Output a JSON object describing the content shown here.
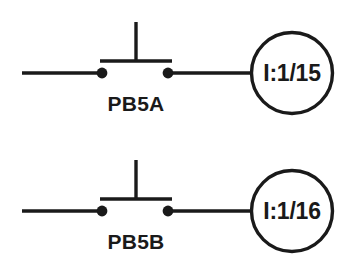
{
  "diagram": {
    "type": "ladder-logic-diagram",
    "background_color": "#ffffff",
    "line_color": "#1a1a1a",
    "rungs": [
      {
        "id": "rung-1",
        "device_label": "PB5A",
        "device_type": "normally-open-pushbutton",
        "terminal_address": "I:1/15",
        "baseline_y": 73
      },
      {
        "id": "rung-2",
        "device_label": "PB5B",
        "device_type": "normally-open-pushbutton",
        "terminal_address": "I:1/16",
        "baseline_y": 211
      }
    ]
  }
}
